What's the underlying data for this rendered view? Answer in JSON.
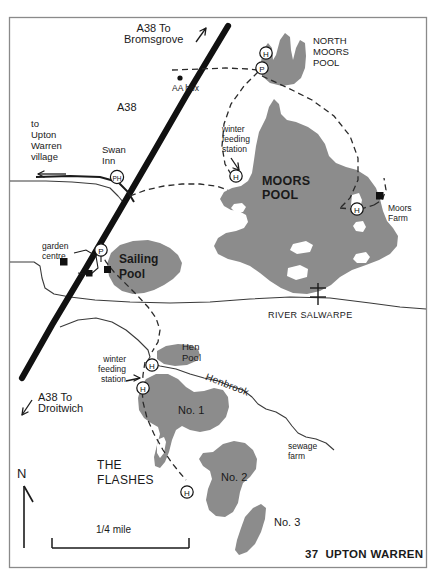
{
  "map": {
    "title": "37  UPTON WARREN",
    "sheet_number": "37",
    "place_name": "UPTON WARREN",
    "north_indicator": "N",
    "scale_label": "1/4 mile",
    "colors": {
      "water_fill": "#8c8c8c",
      "road_major": "#111111",
      "frame": "#7a7a7a",
      "background": "#ffffff",
      "text": "#1a1a1a"
    },
    "roads": [
      {
        "name": "A38",
        "label": "A38",
        "type": "major-road"
      },
      {
        "name": "a38-to-bromsgrove",
        "label": "A38 To\nBromsgrove",
        "direction": "north-east"
      },
      {
        "name": "a38-to-droitwich",
        "label": "A38 To\nDroitwich",
        "direction": "south-west"
      },
      {
        "name": "to-upton-warren-village",
        "label": "to\nUpton\nWarren\nvillage",
        "direction": "west"
      }
    ],
    "water_bodies": [
      {
        "id": "north-moors-pool",
        "label": "NORTH\nMOORS\nPOOL"
      },
      {
        "id": "moors-pool",
        "label": "MOORS\nPOOL"
      },
      {
        "id": "sailing-pool",
        "label": "Sailing\nPool"
      },
      {
        "id": "hen-pool",
        "label": "Hen\nPool"
      },
      {
        "id": "flash-no-1",
        "label": "No. 1"
      },
      {
        "id": "flash-no-2",
        "label": "No. 2"
      },
      {
        "id": "flash-no-3",
        "label": "No. 3"
      }
    ],
    "watercourses": [
      {
        "id": "river-salwarpe",
        "label": "RIVER SALWARPE"
      },
      {
        "id": "henbrook",
        "label": "Henbrook"
      }
    ],
    "area_labels": [
      {
        "id": "the-flashes",
        "label": "THE\nFLASHES"
      }
    ],
    "points_of_interest": [
      {
        "id": "swan-inn",
        "label": "Swan\nInn",
        "marker": "PH"
      },
      {
        "id": "aa-box",
        "label": "AA box",
        "marker": "dot"
      },
      {
        "id": "garden-centre",
        "label": "garden\ncentre",
        "marker": "building"
      },
      {
        "id": "moors-farm",
        "label": "Moors\nFarm",
        "marker": "building"
      },
      {
        "id": "sewage-farm",
        "label": "sewage\nfarm",
        "marker": "none"
      },
      {
        "id": "winter-feeding-station-north",
        "label": "winter\nfeeding\nstation",
        "marker": "arrow"
      },
      {
        "id": "winter-feeding-station-south",
        "label": "winter\nfeeding\nstation",
        "marker": "arrow"
      }
    ],
    "markers": {
      "parking": "P",
      "hide": "H",
      "public_house": "PH"
    },
    "hides": [
      {
        "id": "hide-north-moors",
        "marker": "H"
      },
      {
        "id": "hide-moors-west",
        "marker": "H"
      },
      {
        "id": "hide-moors-east",
        "marker": "H"
      },
      {
        "id": "hide-hen-pool",
        "marker": "H"
      },
      {
        "id": "hide-flash-1",
        "marker": "H"
      },
      {
        "id": "hide-flash-2",
        "marker": "H"
      }
    ],
    "parking_markers": [
      {
        "id": "parking-north",
        "marker": "P"
      },
      {
        "id": "parking-sailing-pool",
        "marker": "P"
      }
    ]
  }
}
